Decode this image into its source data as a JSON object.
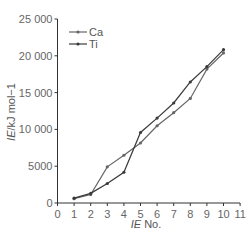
{
  "chart_data": {
    "type": "line",
    "title": "",
    "xlabel": "IE No.",
    "ylabel": "IE/kJ mol−1",
    "x": [
      1,
      2,
      3,
      4,
      5,
      6,
      7,
      8,
      9,
      10
    ],
    "xticks": [
      "0",
      "1",
      "2",
      "3",
      "4",
      "5",
      "6",
      "7",
      "8",
      "9",
      "10",
      "11"
    ],
    "yticks": [
      "0",
      "5000",
      "10 000",
      "15 000",
      "20 000",
      "25 000"
    ],
    "xlim": [
      0,
      11
    ],
    "ylim": [
      0,
      25000
    ],
    "grid": false,
    "legend_position": "top-left",
    "series": [
      {
        "name": "Ca",
        "color": "#666666",
        "values": [
          590,
          1145,
          4912,
          6491,
          8153,
          10496,
          12270,
          14206,
          18191,
          20385
        ]
      },
      {
        "name": "Ti",
        "color": "#3a3a3a",
        "values": [
          658,
          1310,
          2652,
          4175,
          9581,
          11533,
          13590,
          16440,
          18530,
          20833
        ]
      }
    ]
  }
}
